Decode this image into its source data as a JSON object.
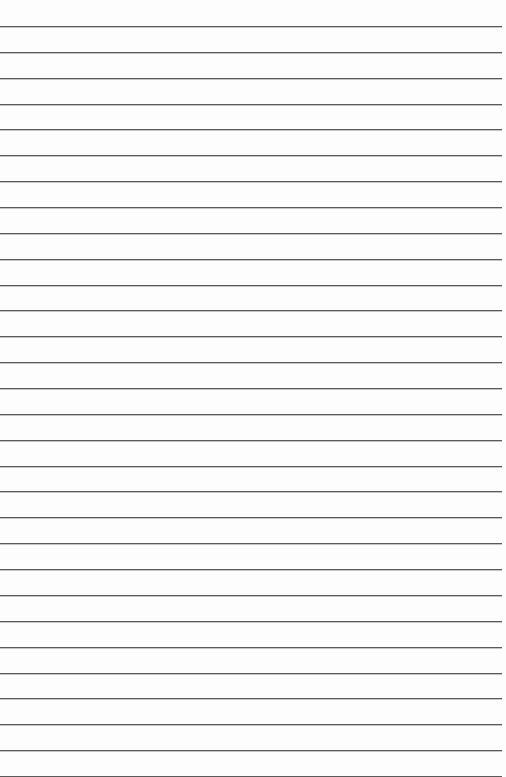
{
  "page": {
    "type": "lined-paper",
    "background_color": "#fdfdfd",
    "line_color": "#5a5a5a",
    "line_count": 30,
    "first_line_y": 26,
    "line_spacing": 25.86,
    "line_left": 0,
    "line_right": 502,
    "text": ""
  }
}
